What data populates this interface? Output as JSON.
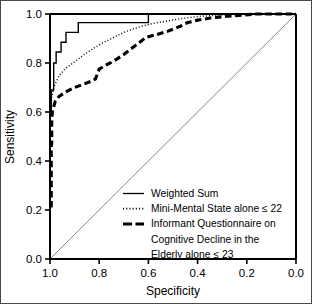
{
  "chart_data": {
    "type": "line",
    "title": "",
    "xlabel": "Specificity",
    "ylabel": "Sensitivity",
    "xlim": [
      1.0,
      0.0
    ],
    "ylim": [
      0.0,
      1.0
    ],
    "x_reversed": true,
    "grid": false,
    "legend_position": "bottom-right",
    "xticks": [
      "1.0",
      "0.8",
      "0.6",
      "0.4",
      "0.2",
      "0.0"
    ],
    "xtick_values": [
      1.0,
      0.8,
      0.6,
      0.4,
      0.2,
      0.0
    ],
    "yticks": [
      "0.0",
      "0.2",
      "0.4",
      "0.6",
      "0.8",
      "1.0"
    ],
    "ytick_values": [
      0.0,
      0.2,
      0.4,
      0.6,
      0.8,
      1.0
    ],
    "reference_line": {
      "name": "chance-diagonal",
      "style": "thin-solid",
      "points": [
        [
          1.0,
          0.0
        ],
        [
          0.0,
          1.0
        ]
      ]
    },
    "series": [
      {
        "name": "Weighted Sum",
        "style": "solid",
        "points": [
          [
            1.0,
            0.0
          ],
          [
            1.0,
            0.6
          ],
          [
            0.995,
            0.6
          ],
          [
            0.995,
            0.69
          ],
          [
            0.985,
            0.69
          ],
          [
            0.985,
            0.8
          ],
          [
            0.975,
            0.8
          ],
          [
            0.975,
            0.845
          ],
          [
            0.955,
            0.845
          ],
          [
            0.955,
            0.885
          ],
          [
            0.935,
            0.885
          ],
          [
            0.935,
            0.925
          ],
          [
            0.885,
            0.925
          ],
          [
            0.885,
            0.965
          ],
          [
            0.6,
            0.965
          ],
          [
            0.6,
            1.0
          ],
          [
            0.0,
            1.0
          ]
        ]
      },
      {
        "name": "Mini-Mental State alone ≤ 22",
        "style": "dotted",
        "points": [
          [
            1.0,
            0.0
          ],
          [
            1.0,
            0.46
          ],
          [
            0.998,
            0.6
          ],
          [
            0.993,
            0.66
          ],
          [
            0.985,
            0.7
          ],
          [
            0.965,
            0.745
          ],
          [
            0.94,
            0.775
          ],
          [
            0.9,
            0.805
          ],
          [
            0.86,
            0.835
          ],
          [
            0.82,
            0.862
          ],
          [
            0.78,
            0.885
          ],
          [
            0.74,
            0.905
          ],
          [
            0.7,
            0.925
          ],
          [
            0.66,
            0.94
          ],
          [
            0.62,
            0.952
          ],
          [
            0.58,
            0.962
          ],
          [
            0.52,
            0.972
          ],
          [
            0.46,
            0.982
          ],
          [
            0.4,
            0.99
          ],
          [
            0.32,
            0.995
          ],
          [
            0.2,
            1.0
          ],
          [
            0.0,
            1.0
          ]
        ]
      },
      {
        "name": "Informant Questionnaire on Cognitive Decline in the Elderly alone ≤ 23",
        "style": "dashed",
        "points": [
          [
            0.995,
            0.21
          ],
          [
            0.995,
            0.465
          ],
          [
            0.993,
            0.47
          ],
          [
            0.993,
            0.56
          ],
          [
            0.99,
            0.605
          ],
          [
            0.978,
            0.645
          ],
          [
            0.962,
            0.665
          ],
          [
            0.93,
            0.685
          ],
          [
            0.9,
            0.7
          ],
          [
            0.86,
            0.715
          ],
          [
            0.835,
            0.725
          ],
          [
            0.815,
            0.735
          ],
          [
            0.8,
            0.775
          ],
          [
            0.775,
            0.79
          ],
          [
            0.755,
            0.8
          ],
          [
            0.73,
            0.815
          ],
          [
            0.7,
            0.835
          ],
          [
            0.665,
            0.862
          ],
          [
            0.635,
            0.885
          ],
          [
            0.61,
            0.905
          ],
          [
            0.57,
            0.915
          ],
          [
            0.52,
            0.93
          ],
          [
            0.47,
            0.95
          ],
          [
            0.44,
            0.965
          ],
          [
            0.4,
            0.975
          ],
          [
            0.34,
            0.985
          ],
          [
            0.26,
            0.992
          ],
          [
            0.16,
            1.0
          ],
          [
            0.0,
            1.0
          ]
        ]
      }
    ],
    "legend": [
      {
        "label": "Weighted Sum",
        "style": "solid"
      },
      {
        "label": "Mini-Mental State alone ≤ 22",
        "style": "dotted"
      },
      {
        "label": "Informant Questionnaire on",
        "style": "dashed"
      },
      {
        "label": "Cognitive Decline in the",
        "style": "none"
      },
      {
        "label": "Elderly alone ≤ 23",
        "style": "none"
      }
    ]
  },
  "colors": {
    "axis": "#000000",
    "curve": "#000000",
    "reference": "#7a7a7a",
    "background": "#ffffff",
    "frame": "#4a4a4a"
  }
}
